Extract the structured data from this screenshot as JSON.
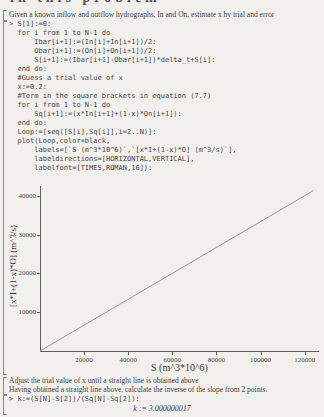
{
  "page": {
    "bg_color": "#f2f0ec",
    "text_color": "#3f3e3c",
    "code_color": "#474645",
    "axis_color": "#5f5e5b"
  },
  "heading_fragment": "in this problem",
  "intro_text": "Given a known inflow and outflow hydrographs, In and On, estimate x by trial and error",
  "code": {
    "lines": [
      "> S[1]:=0:",
      "  for i from 1 to N-1 do",
      "      Ibar[i+1]:=(In[i]+In[i+1])/2:",
      "      Obar[i+1]:=(On[i]+On[i+1])/2:",
      "      S[i+1]:=(Ibar[i+1]-Obar[i+1])*delta_t+S[i]:",
      "  end do:",
      "  #Guess a trial value of x",
      "  x:=0.2:",
      "  #Term in the square brackets in equation (7.7)",
      "  for i from 1 to N-1 do",
      "      Sq[i+1]:=(x*In[i+1]+(1-x)*On[i+1]):",
      "  end do:",
      "  Loop:=[seq([S[i],Sq[i]],i=2..N)]:",
      "  plot(Loop,color=black,",
      "      labels=[`S (m^3*10^6)`,`[x*I+(1-x)*O] (m^3/s)`],",
      "      labeldirections=[HORIZONTAL,VERTICAL],",
      "      labelfont=[TIMES,ROMAN,16]):"
    ]
  },
  "chart_data": {
    "type": "line",
    "title": "",
    "xlabel": "S (m^3*10^6)",
    "ylabel": "[x*I+(1-x)*O] (m^3/s)",
    "xlim": [
      0,
      126500
    ],
    "ylim": [
      0,
      42500
    ],
    "xticks": [
      20000,
      40000,
      60000,
      80000,
      100000,
      120000
    ],
    "yticks": [
      10000,
      20000,
      30000,
      40000
    ],
    "grid": false,
    "legend": false,
    "series": [
      {
        "name": "Loop",
        "color": "#9b9a97",
        "slope": 0.3333,
        "x": [
          0,
          124000
        ],
        "y": [
          0,
          41330
        ]
      }
    ]
  },
  "post_text": {
    "line1": "Adjust the trial value of x until a straight line is obtained above",
    "line2": "Having obtained a straight line above, calculate the inverse of the slope from 2 points."
  },
  "final_input": "> k:=(S[N]-S[2])/(Sq[N]-Sq[2]):",
  "final_output": "k := 3.000000017"
}
